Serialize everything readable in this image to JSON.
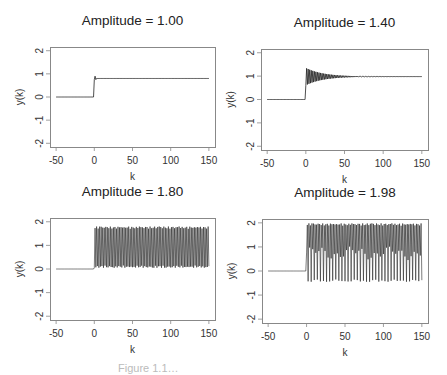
{
  "caption": "Figure 1.1…",
  "chart_data": [
    {
      "type": "line",
      "title": "Amplitude = 1.00",
      "xlabel": "k",
      "ylabel": "y(k)",
      "xlim": [
        -50,
        150
      ],
      "ylim": [
        -2,
        2
      ],
      "xticks": [
        -50,
        0,
        50,
        100,
        150
      ],
      "yticks": [
        -2,
        -1,
        0,
        1,
        2
      ],
      "grid": false,
      "series": [
        {
          "name": "y(k)",
          "behavior": "step at k=0, small overshoot then constant",
          "pre_step": 0,
          "settle": 0.8,
          "peak": 0.9,
          "env_low": 0.8,
          "env_high": 0.8
        }
      ],
      "frame": {
        "x": 50,
        "y": 47,
        "w": 165,
        "h": 100
      }
    },
    {
      "type": "line",
      "title": "Amplitude = 1.40",
      "xlabel": "k",
      "ylabel": "y(k)",
      "xlim": [
        -50,
        150
      ],
      "ylim": [
        -2,
        2
      ],
      "xticks": [
        -50,
        0,
        50,
        100,
        150
      ],
      "yticks": [
        -2,
        -1,
        0,
        1,
        2
      ],
      "grid": false,
      "series": [
        {
          "name": "y(k)",
          "behavior": "step at k=0, damped oscillation converging to ~1.0",
          "pre_step": 0,
          "settle": 0.98,
          "peak": 1.35,
          "env_low": 0.7,
          "env_high": 1.35,
          "decay": true
        }
      ],
      "frame": {
        "x": 261,
        "y": 49,
        "w": 167,
        "h": 101
      }
    },
    {
      "type": "line",
      "title": "Amplitude = 1.80",
      "xlabel": "k",
      "ylabel": "y(k)",
      "xlim": [
        -50,
        150
      ],
      "ylim": [
        -2,
        2
      ],
      "xticks": [
        -50,
        0,
        50,
        100,
        150
      ],
      "yticks": [
        -2,
        -1,
        0,
        1,
        2
      ],
      "grid": false,
      "series": [
        {
          "name": "y(k)",
          "behavior": "step at k=0, sustained oscillation",
          "pre_step": 0,
          "settle": 0.9,
          "env_low": 0.05,
          "env_high": 1.8
        }
      ],
      "frame": {
        "x": 50,
        "y": 218,
        "w": 165,
        "h": 102
      }
    },
    {
      "type": "line",
      "title": "Amplitude = 1.98",
      "xlabel": "k",
      "ylabel": "y(k)",
      "xlim": [
        -50,
        150
      ],
      "ylim": [
        -2,
        2
      ],
      "xticks": [
        -50,
        0,
        50,
        100,
        150
      ],
      "yticks": [
        -2,
        -1,
        0,
        1,
        2
      ],
      "grid": false,
      "series": [
        {
          "name": "y(k)",
          "behavior": "step at k=0, large sustained oscillation",
          "pre_step": 0,
          "settle": 0.75,
          "env_low": -0.45,
          "env_high": 1.98
        }
      ],
      "frame": {
        "x": 262,
        "y": 219,
        "w": 166,
        "h": 104
      }
    }
  ]
}
